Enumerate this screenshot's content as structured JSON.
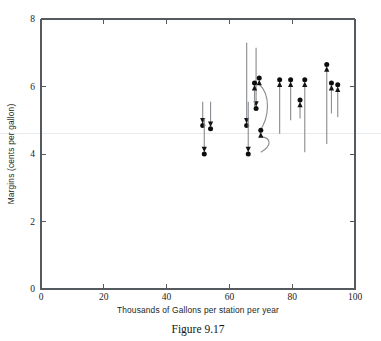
{
  "figure": {
    "caption": "Figure 9.17",
    "xlabel": "Thousands of Gallons per station per year",
    "ylabel": "Margins (cents per gallon)"
  },
  "axes": {
    "x_ticks": [
      "0",
      "20",
      "40",
      "60",
      "80",
      "100"
    ],
    "y_ticks": [
      "0",
      "2",
      "4",
      "6",
      "8"
    ],
    "x_tick_values": [
      0,
      20,
      40,
      60,
      80,
      100
    ],
    "y_tick_values": [
      0,
      2,
      4,
      6,
      8
    ],
    "reference_line_value": 4.6
  },
  "chart_data": {
    "type": "scatter",
    "title": "Figure 9.17",
    "xlabel": "Thousands of Gallons per station per year",
    "ylabel": "Margins (cents per gallon)",
    "xlim": [
      0,
      100
    ],
    "ylim": [
      0,
      8
    ],
    "grid": false,
    "legend": null,
    "annotations": [
      {
        "label": "reference line",
        "y": 4.6,
        "style": "faint horizontal line"
      }
    ],
    "series": [
      {
        "name": "margin change arrows",
        "marker": "filled circle at arrow head",
        "arrows": [
          {
            "x": 51.5,
            "y_start": 5.55,
            "y_end": 4.9,
            "direction": "down",
            "curved": false
          },
          {
            "x": 54.0,
            "y_start": 5.55,
            "y_end": 4.8,
            "direction": "down",
            "curved": false
          },
          {
            "x": 52.0,
            "y_start": 5.05,
            "y_end": 4.05,
            "direction": "down",
            "curved": false
          },
          {
            "x": 65.5,
            "y_start": 7.3,
            "y_end": 4.9,
            "direction": "down",
            "curved": false
          },
          {
            "x": 66.0,
            "y_start": 5.55,
            "y_end": 4.05,
            "direction": "down",
            "curved": false
          },
          {
            "x": 68.5,
            "y_start": 7.15,
            "y_end": 5.4,
            "direction": "up",
            "curved": false
          },
          {
            "x": 68.0,
            "y_start": 5.4,
            "y_end": 6.05,
            "direction": "up",
            "curved": false
          },
          {
            "x": 69.5,
            "y_start": 4.65,
            "y_end": 6.2,
            "direction": "up",
            "curved": true
          },
          {
            "x": 70.0,
            "y_start": 4.05,
            "y_end": 4.65,
            "direction": "up",
            "curved": true
          },
          {
            "x": 76.0,
            "y_start": 4.6,
            "y_end": 6.15,
            "direction": "up",
            "curved": false
          },
          {
            "x": 79.5,
            "y_start": 5.0,
            "y_end": 6.15,
            "direction": "up",
            "curved": false
          },
          {
            "x": 82.5,
            "y_start": 5.05,
            "y_end": 5.55,
            "direction": "up",
            "curved": false
          },
          {
            "x": 84.0,
            "y_start": 4.05,
            "y_end": 6.15,
            "direction": "up",
            "curved": false
          },
          {
            "x": 91.0,
            "y_start": 4.3,
            "y_end": 6.6,
            "direction": "up",
            "curved": false
          },
          {
            "x": 92.5,
            "y_start": 5.2,
            "y_end": 6.05,
            "direction": "up",
            "curved": false
          },
          {
            "x": 94.5,
            "y_start": 5.1,
            "y_end": 6.0,
            "direction": "up",
            "curved": false
          }
        ]
      }
    ]
  }
}
